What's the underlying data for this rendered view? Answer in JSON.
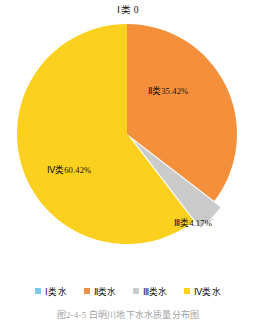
{
  "chart_data": {
    "type": "pie",
    "title": "图2-4-5  白明川地下水水质量分布图",
    "top_annotation": "Ⅰ类 0",
    "categories": [
      "Ⅰ类",
      "Ⅱ类",
      "Ⅲ类",
      "Ⅳ类"
    ],
    "values": [
      0,
      35.42,
      4.17,
      60.42
    ],
    "value_unit": "%",
    "slice_labels": [
      "Ⅰ类 0",
      "Ⅱ类35.42%",
      "Ⅲ类4.17%",
      "Ⅳ类60.42%"
    ],
    "colors": [
      "#7FC9E8",
      "#F4903C",
      "#CBCBCB",
      "#FBD01E"
    ],
    "exploded": [
      false,
      false,
      true,
      false
    ],
    "start_angle_deg": 0,
    "direction": "clockwise",
    "legend_position": "bottom",
    "grid": false,
    "xlabel": "",
    "ylabel": ""
  },
  "legend": {
    "items": [
      {
        "label": "Ⅰ类水",
        "color": "#7FC9E8"
      },
      {
        "label": "Ⅱ类水",
        "color": "#F4903C"
      },
      {
        "label": "Ⅲ类水",
        "color": "#CBCBCB"
      },
      {
        "label": "Ⅳ类水",
        "color": "#FBD01E"
      }
    ]
  },
  "caption": "图2-4-5  白明川地下水水质量分布图"
}
